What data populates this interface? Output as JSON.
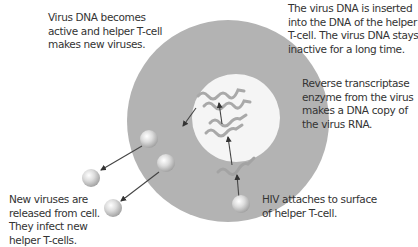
{
  "diagram": {
    "colors": {
      "cell": "#b3b3b3",
      "nucleus": "#f5f5f5",
      "rna_strand": "#a9a9a9",
      "dna_strand": "#9a9a9a",
      "arrow": "#444444",
      "text": "#333333",
      "virus_light": "#f4f4f4",
      "virus_dark": "#9c9c9c"
    },
    "labels": {
      "step_active": {
        "lines": [
          "Virus DNA becomes",
          "active and helper T-cell",
          "makes new viruses."
        ]
      },
      "step_inserted": {
        "lines": [
          "The virus DNA is inserted",
          "into the DNA of the helper",
          "T-cell. The virus DNA stays",
          "inactive for a long time."
        ]
      },
      "step_reverse": {
        "lines": [
          "Reverse transcriptase",
          "enzyme from the virus",
          "makes a DNA copy of",
          "the virus RNA."
        ]
      },
      "step_released": {
        "lines": [
          "New viruses are",
          "released from cell.",
          "They infect new",
          "helper T-cells."
        ]
      },
      "step_attach": {
        "lines": [
          "HIV attaches to surface",
          "of helper T-cell."
        ]
      }
    }
  }
}
